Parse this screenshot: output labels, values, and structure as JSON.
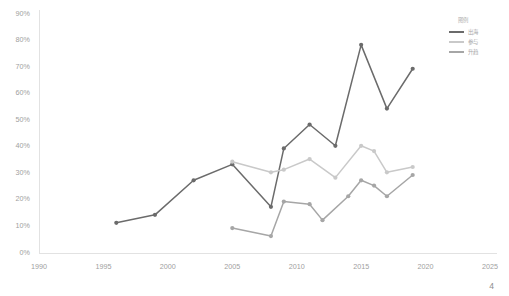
{
  "page": {
    "number": "4"
  },
  "legend": {
    "title": "图例",
    "entries": [
      {
        "label": "出海",
        "color": "#6b6b6b"
      },
      {
        "label": "参与",
        "color": "#c9c9c9"
      },
      {
        "label": "升趋",
        "color": "#a6a6a6"
      }
    ]
  },
  "chart_data": {
    "type": "line",
    "title": "",
    "subtitle": "",
    "xlabel": "",
    "ylabel": "",
    "xlim": [
      1990,
      2025
    ],
    "ylim": [
      0,
      90
    ],
    "grid": false,
    "legend_position": "top-right",
    "xticks": [
      "1990",
      "1995",
      "2000",
      "2005",
      "2010",
      "2015",
      "2020",
      "2025"
    ],
    "xtick_values": [
      1990,
      1995,
      2000,
      2005,
      2010,
      2015,
      2020,
      2025
    ],
    "yticks": [
      "0%",
      "10%",
      "20%",
      "30%",
      "40%",
      "50%",
      "60%",
      "70%",
      "80%",
      "90%"
    ],
    "ytick_values": [
      0,
      10,
      20,
      30,
      40,
      50,
      60,
      70,
      80,
      90
    ],
    "series": [
      {
        "name": "出海",
        "color": "#6b6b6b",
        "x": [
          1996,
          1999,
          2002,
          2005,
          2008,
          2009,
          2011,
          2013,
          2015,
          2017,
          2019
        ],
        "values": [
          11,
          14,
          27,
          33,
          17,
          39,
          48,
          40,
          78,
          54,
          69
        ]
      },
      {
        "name": "参与",
        "color": "#c9c9c9",
        "x": [
          2005,
          2008,
          2009,
          2011,
          2013,
          2015,
          2016,
          2017,
          2019
        ],
        "values": [
          34,
          30,
          31,
          35,
          28,
          40,
          38,
          30,
          32
        ]
      },
      {
        "name": "升趋",
        "color": "#a6a6a6",
        "x": [
          2005,
          2008,
          2009,
          2011,
          2012,
          2014,
          2015,
          2016,
          2017,
          2019
        ],
        "values": [
          9,
          6,
          19,
          18,
          12,
          21,
          27,
          25,
          21,
          29
        ]
      }
    ]
  }
}
